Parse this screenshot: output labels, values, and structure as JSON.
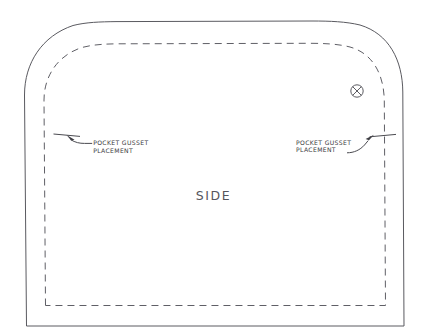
{
  "drawing": {
    "kind": "sewing-pattern-piece",
    "piece_label": "SIDE",
    "background_color": "#ffffff",
    "line_color": "#55555c",
    "annotations": {
      "left_gusset": {
        "line1": "POCKET GUSSET",
        "line2": "PLACEMENT"
      },
      "right_gusset": {
        "line1": "POCKET GUSSET",
        "line2": "PLACEMENT"
      }
    },
    "marks": {
      "drill_hole": "circled-x-mark"
    }
  }
}
